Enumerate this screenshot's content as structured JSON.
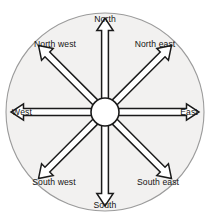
{
  "figure": {
    "name": "compass-rose"
  },
  "colors": {
    "disc_fill": "#f2f1f0",
    "disc_stroke": "#9b9b9b",
    "arrow_fill": "#ffffff",
    "arrow_stroke": "#1a1a1a",
    "hub_fill": "#ffffff",
    "hub_stroke": "#1a1a1a",
    "label_color": "#141414",
    "background": "#ffffff"
  },
  "geometry": {
    "center_x": 105,
    "center_y": 112,
    "disc_radius": 99,
    "hub_radius": 14,
    "arrow_length": 80
  },
  "directions": [
    {
      "key": "north",
      "label": "North",
      "bearing_deg": 0,
      "label_x": 105,
      "label_y": 19
    },
    {
      "key": "north-east",
      "label": "North east",
      "bearing_deg": 45,
      "label_x": 155,
      "label_y": 44
    },
    {
      "key": "east",
      "label": "East",
      "bearing_deg": 90,
      "label_x": 189,
      "label_y": 112
    },
    {
      "key": "south-east",
      "label": "South east",
      "bearing_deg": 135,
      "label_x": 158,
      "label_y": 182
    },
    {
      "key": "south",
      "label": "South",
      "bearing_deg": 180,
      "label_x": 105,
      "label_y": 205
    },
    {
      "key": "south-west",
      "label": "South west",
      "bearing_deg": 225,
      "label_x": 54,
      "label_y": 182
    },
    {
      "key": "west",
      "label": "West",
      "bearing_deg": 270,
      "label_x": 22,
      "label_y": 112
    },
    {
      "key": "north-west",
      "label": "North west",
      "bearing_deg": 315,
      "label_x": 55,
      "label_y": 44
    }
  ]
}
